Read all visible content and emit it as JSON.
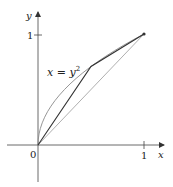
{
  "diagram": {
    "axes": {
      "x_label": "x",
      "y_label": "y",
      "origin_label": "0",
      "x_tick_label": "1",
      "y_tick_label": "1"
    },
    "curve": {
      "label": "x = y",
      "label_exponent": "2",
      "equation": "x = y^2",
      "color": "#8a8a8a"
    },
    "diagonal": {
      "equation": "y = x",
      "color": "#9a9a9a"
    },
    "polygon": {
      "vertices": [
        [
          0,
          0
        ],
        [
          0.5,
          0.7071
        ],
        [
          1,
          1
        ]
      ],
      "color": "#333333"
    },
    "endpoint": [
      1,
      1
    ]
  }
}
